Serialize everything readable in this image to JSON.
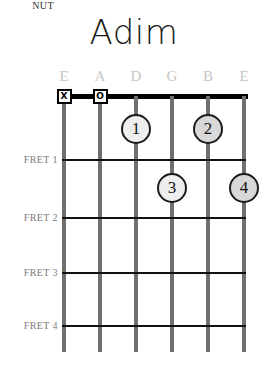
{
  "chord": {
    "title": "Adim",
    "nut_label": "NUT",
    "strings": [
      {
        "name": "E",
        "x": 64
      },
      {
        "name": "A",
        "x": 100
      },
      {
        "name": "D",
        "x": 136
      },
      {
        "name": "G",
        "x": 172
      },
      {
        "name": "B",
        "x": 208
      },
      {
        "name": "E",
        "x": 244
      }
    ],
    "fret_labels": [
      {
        "label": "FRET 1",
        "y": 159
      },
      {
        "label": "FRET 2",
        "y": 217
      },
      {
        "label": "FRET 3",
        "y": 272
      },
      {
        "label": "FRET 4",
        "y": 325
      }
    ],
    "open_markers": [
      {
        "symbol": "X",
        "string": "E",
        "x": 64,
        "y": 96,
        "meaning": "muted"
      },
      {
        "symbol": "O",
        "string": "A",
        "x": 100,
        "y": 96,
        "meaning": "open"
      }
    ],
    "finger_dots": [
      {
        "finger": "1",
        "string": "D",
        "fret": 1,
        "x": 136,
        "y": 129,
        "fill": "#eeeeee"
      },
      {
        "finger": "2",
        "string": "B",
        "fret": 1,
        "x": 208,
        "y": 129,
        "fill": "#d8d8d8"
      },
      {
        "finger": "3",
        "string": "G",
        "fret": 2,
        "x": 172,
        "y": 188,
        "fill": "#eeeeee"
      },
      {
        "finger": "4",
        "string": "E",
        "fret": 2,
        "x": 244,
        "y": 188,
        "fill": "#d8d8d8"
      }
    ],
    "colors": {
      "nut": "#000000",
      "fret": "#111111",
      "string": "#6f6f6f",
      "string_label": "#c6c6c6",
      "fret_label": "#7d7d7d",
      "title": "#1a1a1a"
    }
  }
}
